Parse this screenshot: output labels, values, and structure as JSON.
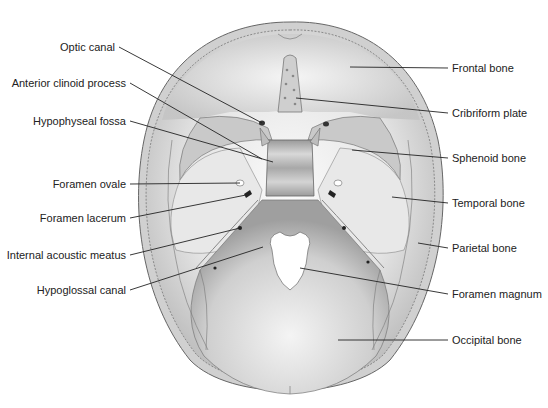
{
  "diagram": {
    "colors": {
      "background": "#ffffff",
      "bone_light": "#f4f4f4",
      "bone_mid": "#d6d6d6",
      "bone_dark": "#a8a8a8",
      "outline": "#555555",
      "foramen": "#ffffff",
      "leader_line": "#222222",
      "text": "#222222"
    },
    "labels_left": [
      {
        "text": "Optic canal",
        "x": 115,
        "y": 47,
        "target": [
          262,
          123
        ]
      },
      {
        "text": "Anterior clinoid process",
        "x": 126,
        "y": 83,
        "target": [
          262,
          159
        ]
      },
      {
        "text": "Hypophyseal fossa",
        "x": 126,
        "y": 121,
        "target": [
          273,
          162
        ]
      },
      {
        "text": "Foramen ovale",
        "x": 126,
        "y": 184,
        "target": [
          240,
          183
        ]
      },
      {
        "text": "Foramen lacerum",
        "x": 126,
        "y": 218,
        "target": [
          246,
          195
        ]
      },
      {
        "text": "Internal acoustic meatus",
        "x": 126,
        "y": 255,
        "target": [
          240,
          228
        ]
      },
      {
        "text": "Hypoglossal canal",
        "x": 126,
        "y": 290,
        "target": [
          263,
          247
        ]
      }
    ],
    "labels_right": [
      {
        "text": "Frontal bone",
        "x": 452,
        "y": 68,
        "target": [
          350,
          67
        ]
      },
      {
        "text": "Cribriform plate",
        "x": 452,
        "y": 113,
        "target": [
          296,
          98
        ]
      },
      {
        "text": "Sphenoid bone",
        "x": 452,
        "y": 158,
        "target": [
          352,
          150
        ]
      },
      {
        "text": "Temporal bone",
        "x": 452,
        "y": 203,
        "target": [
          392,
          197
        ]
      },
      {
        "text": "Parietal bone",
        "x": 452,
        "y": 248,
        "target": [
          418,
          243
        ]
      },
      {
        "text": "Foramen magnum",
        "x": 452,
        "y": 294,
        "target": [
          300,
          268
        ]
      },
      {
        "text": "Occipital bone",
        "x": 452,
        "y": 340,
        "target": [
          338,
          340
        ]
      }
    ]
  }
}
